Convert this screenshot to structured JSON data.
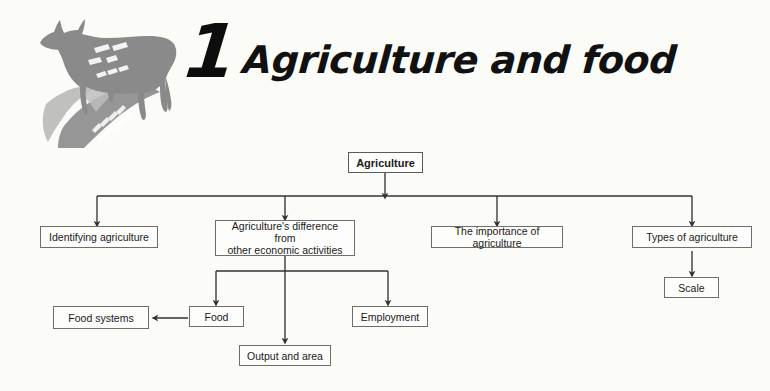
{
  "header": {
    "chapter_number": "1",
    "title": "Agriculture and food",
    "artwork_icons": [
      "cow-silhouette-icon",
      "maize-cob-icon"
    ]
  },
  "diagram": {
    "type": "hierarchy-flowchart",
    "nodes": {
      "root": {
        "label": "Agriculture",
        "bold": true
      },
      "level2": [
        {
          "id": "identifying-agriculture",
          "label": "Identifying agriculture"
        },
        {
          "id": "agriculture-difference",
          "label": "Agriculture's difference from\nother economic activities"
        },
        {
          "id": "importance-of-agriculture",
          "label": "The importance of agriculture"
        },
        {
          "id": "types-of-agriculture",
          "label": "Types of agriculture"
        }
      ],
      "level3": [
        {
          "id": "food",
          "label": "Food"
        },
        {
          "id": "output-and-area",
          "label": "Output and area"
        },
        {
          "id": "employment",
          "label": "Employment"
        },
        {
          "id": "scale",
          "label": "Scale"
        }
      ],
      "level4": [
        {
          "id": "food-systems",
          "label": "Food systems"
        }
      ]
    },
    "edges": [
      {
        "from": "root",
        "to": "identifying-agriculture"
      },
      {
        "from": "root",
        "to": "agriculture-difference"
      },
      {
        "from": "root",
        "to": "importance-of-agriculture"
      },
      {
        "from": "root",
        "to": "types-of-agriculture"
      },
      {
        "from": "agriculture-difference",
        "to": "food"
      },
      {
        "from": "agriculture-difference",
        "to": "output-and-area"
      },
      {
        "from": "agriculture-difference",
        "to": "employment"
      },
      {
        "from": "types-of-agriculture",
        "to": "scale"
      },
      {
        "from": "food",
        "to": "food-systems"
      }
    ],
    "colors": {
      "background": "#fbfbf8",
      "box_border": "#6e6e6e",
      "box_fill": "#fdfdfb",
      "connector": "#333333",
      "text": "#1a1a1a",
      "artwork_grey": "#8d8d8d"
    }
  }
}
